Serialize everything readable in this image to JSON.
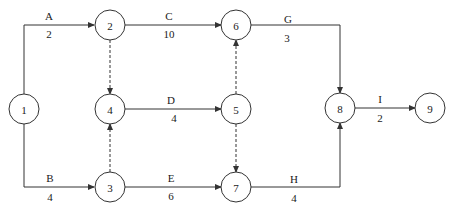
{
  "diagram": {
    "type": "activity-on-arrow network",
    "nodes": [
      {
        "id": "1",
        "label": "1",
        "x": 24,
        "y": 109
      },
      {
        "id": "2",
        "label": "2",
        "x": 110,
        "y": 25
      },
      {
        "id": "3",
        "label": "3",
        "x": 110,
        "y": 187
      },
      {
        "id": "4",
        "label": "4",
        "x": 110,
        "y": 109
      },
      {
        "id": "5",
        "label": "5",
        "x": 236,
        "y": 109
      },
      {
        "id": "6",
        "label": "6",
        "x": 236,
        "y": 25
      },
      {
        "id": "7",
        "label": "7",
        "x": 236,
        "y": 187
      },
      {
        "id": "8",
        "label": "8",
        "x": 340,
        "y": 108
      },
      {
        "id": "9",
        "label": "9",
        "x": 430,
        "y": 108
      }
    ],
    "activities": [
      {
        "name": "A",
        "duration": "2",
        "from": "1",
        "to": "2"
      },
      {
        "name": "B",
        "duration": "4",
        "from": "1",
        "to": "3"
      },
      {
        "name": "C",
        "duration": "10",
        "from": "2",
        "to": "6"
      },
      {
        "name": "D",
        "duration": "4",
        "from": "4",
        "to": "5"
      },
      {
        "name": "E",
        "duration": "6",
        "from": "3",
        "to": "7"
      },
      {
        "name": "G",
        "duration": "3",
        "from": "6",
        "to": "8"
      },
      {
        "name": "H",
        "duration": "4",
        "from": "7",
        "to": "8"
      },
      {
        "name": "I",
        "duration": "2",
        "from": "8",
        "to": "9"
      }
    ],
    "dummy_activities": [
      {
        "from": "2",
        "to": "4"
      },
      {
        "from": "3",
        "to": "4"
      },
      {
        "from": "5",
        "to": "6"
      },
      {
        "from": "5",
        "to": "7"
      }
    ]
  }
}
